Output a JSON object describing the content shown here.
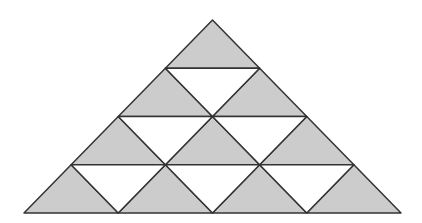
{
  "diagram": {
    "type": "triangular-grid",
    "rows": 4,
    "apex": [
      212.5,
      20
    ],
    "base_y": 213,
    "base_left_x": 24,
    "base_right_x": 401,
    "colors": {
      "shaded": "#cccccc",
      "unshaded": "#ffffff",
      "stroke": "#333333",
      "background": "#ffffff"
    },
    "stroke_width": 1.5,
    "counts": {
      "shaded_up_triangles": 10,
      "white_down_triangles": 6,
      "total_small_triangles": 16
    }
  }
}
